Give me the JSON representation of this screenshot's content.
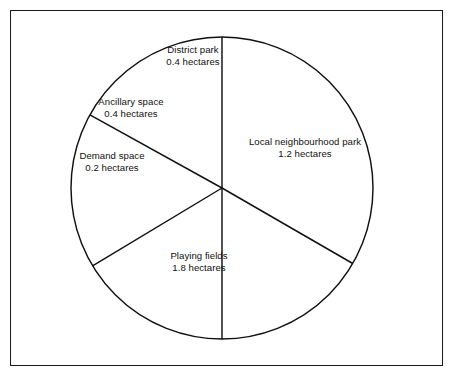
{
  "figure": {
    "frame_color": "#1a1a1a",
    "background_color": "#ffffff",
    "stroke_color": "#111111"
  },
  "chart_data": {
    "type": "pie",
    "title": "",
    "unit": "hectares",
    "total": 4.0,
    "legend": "none",
    "labels_inline": true,
    "categories": [
      "Local neighbourhood park",
      "Playing fields",
      "Demand space",
      "Ancillary space",
      "District park"
    ],
    "values": [
      1.2,
      1.8,
      0.2,
      0.4,
      0.4
    ],
    "slices": [
      {
        "name": "Local neighbourhood park",
        "value": 1.2,
        "value_text": "1.2 hectares",
        "share_degrees": 108,
        "start_degrees": 0,
        "end_degrees": 120,
        "fill": "#ffffff"
      },
      {
        "name": "Playing fields",
        "value": 1.8,
        "value_text": "1.8 hectares",
        "share_degrees": 162,
        "start_degrees": 120,
        "end_degrees": 180,
        "fill": "#ffffff"
      },
      {
        "name": "Demand space",
        "value": 0.2,
        "value_text": "0.2 hectares",
        "share_degrees": 18,
        "start_degrees": 180,
        "end_degrees": 239,
        "fill": "#ffffff"
      },
      {
        "name": "Ancillary space",
        "value": 0.4,
        "value_text": "0.4 hectares",
        "share_degrees": 36,
        "start_degrees": 239,
        "end_degrees": 299,
        "fill": "#ffffff"
      },
      {
        "name": "District park",
        "value": 0.4,
        "value_text": "0.4 hectares",
        "share_degrees": 36,
        "start_degrees": 299,
        "end_degrees": 360,
        "fill": "#ffffff"
      }
    ]
  }
}
